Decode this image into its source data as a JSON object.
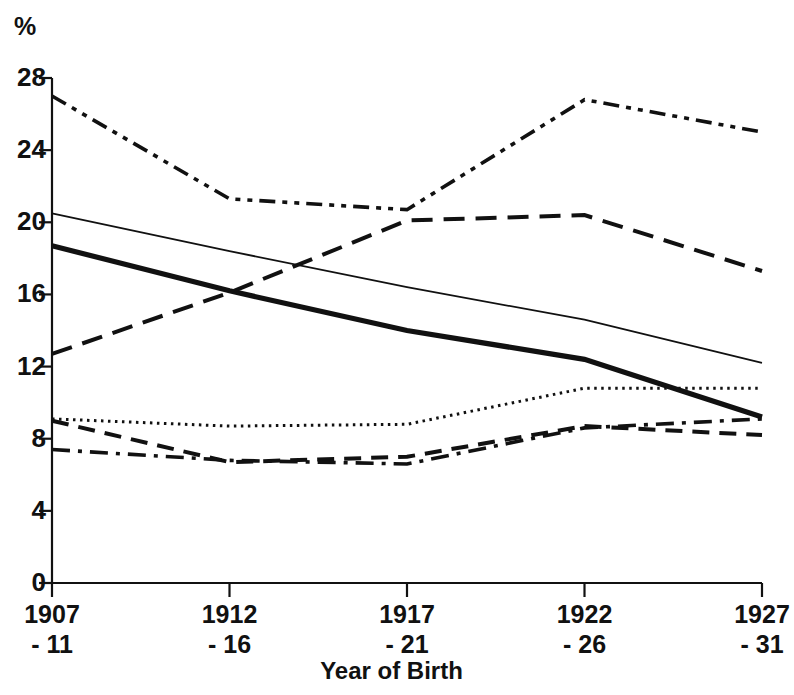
{
  "chart_data": {
    "type": "line",
    "title": "",
    "unit_label": "%",
    "xlabel": "Year of Birth",
    "ylabel": "%",
    "categories": [
      "1907 - 11",
      "1912 - 16",
      "1917 - 21",
      "1922 - 26",
      "1927 - 31"
    ],
    "x_tick_labels": [
      {
        "line1": "1907",
        "line2": "- 11"
      },
      {
        "line1": "1912",
        "line2": "- 16"
      },
      {
        "line1": "1917",
        "line2": "- 21"
      },
      {
        "line1": "1922",
        "line2": "- 26"
      },
      {
        "line1": "1927",
        "line2": "- 31"
      }
    ],
    "y_tick_labels": [
      "28",
      "24",
      "20",
      "16",
      "12",
      "8",
      "4",
      "0"
    ],
    "y_tick_values": [
      28,
      24,
      20,
      16,
      12,
      8,
      4,
      0
    ],
    "ylim": [
      0,
      28
    ],
    "grid": false,
    "legend": "none",
    "axis_color": "#111111",
    "series": [
      {
        "name": "series-dash-dot-dot",
        "style": "dash-dot-dot",
        "stroke_width": 3.6,
        "color": "#111111",
        "dasharray": "16,7,5,7,5,7",
        "values": [
          27.0,
          21.3,
          20.7,
          26.8,
          25.0
        ]
      },
      {
        "name": "series-thin-solid",
        "style": "solid-thin",
        "stroke_width": 1.8,
        "color": "#111111",
        "dasharray": "",
        "values": [
          20.5,
          18.4,
          16.4,
          14.6,
          12.2
        ]
      },
      {
        "name": "series-thick-solid",
        "style": "solid-thick",
        "stroke_width": 5.2,
        "color": "#111111",
        "dasharray": "",
        "values": [
          18.7,
          16.2,
          14.0,
          12.4,
          9.2
        ]
      },
      {
        "name": "series-long-dash",
        "style": "long-dash",
        "stroke_width": 4.0,
        "color": "#111111",
        "dasharray": "21,11",
        "values": [
          12.7,
          16.1,
          20.1,
          20.4,
          17.3
        ]
      },
      {
        "name": "series-dotted",
        "style": "dotted",
        "stroke_width": 3.0,
        "color": "#111111",
        "dasharray": "2.5,4.5",
        "values": [
          9.1,
          8.7,
          8.8,
          10.8,
          10.8
        ]
      },
      {
        "name": "series-medium-dash",
        "style": "medium-dash",
        "stroke_width": 4.0,
        "color": "#111111",
        "dasharray": "17,10",
        "values": [
          9.0,
          6.7,
          7.0,
          8.7,
          8.2
        ]
      },
      {
        "name": "series-dash-dot",
        "style": "dash-dot",
        "stroke_width": 3.6,
        "color": "#111111",
        "dasharray": "18,8,4,8",
        "values": [
          7.4,
          6.8,
          6.6,
          8.6,
          9.1
        ]
      }
    ]
  },
  "geometry": {
    "plot_left": 52,
    "plot_right": 762,
    "y_top_px": 78,
    "y_bottom_px": 583,
    "y_top_value": 28,
    "y_bottom_value": 0
  }
}
